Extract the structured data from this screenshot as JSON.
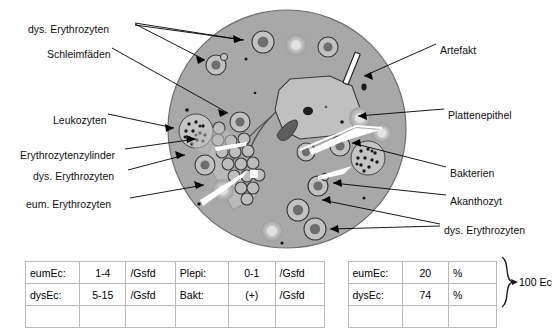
{
  "figure": {
    "type": "urine-sediment-microscopy-diagram",
    "field_shape": "circle",
    "labels_left": [
      {
        "id": "dys-erythrozyten-top",
        "text": "dys. Erythrozyten",
        "x": 28,
        "y": 23
      },
      {
        "id": "schleimfaeden",
        "text": "Schleimfäden",
        "x": 47,
        "y": 48
      },
      {
        "id": "leukozyten",
        "text": "Leukozyten",
        "x": 53,
        "y": 114
      },
      {
        "id": "erythrozytenzylinder",
        "text": "Erythrozytenzylinder",
        "x": 20,
        "y": 149
      },
      {
        "id": "dys-erythrozyten-mid",
        "text": "dys. Erythrozyten",
        "x": 33,
        "y": 170
      },
      {
        "id": "eum-erythrozyten",
        "text": "eum. Erythrozyten",
        "x": 26,
        "y": 198
      }
    ],
    "labels_right": [
      {
        "id": "artefakt",
        "text": "Artefakt",
        "x": 440,
        "y": 44
      },
      {
        "id": "plattenepithel",
        "text": "Plattenepithel",
        "x": 448,
        "y": 109
      },
      {
        "id": "bakterien",
        "text": "Bakterien",
        "x": 450,
        "y": 167
      },
      {
        "id": "akanthozyt",
        "text": "Akanthozyt",
        "x": 450,
        "y": 195
      },
      {
        "id": "dys-erythrozyten-bottom",
        "text": "dys. Erythrozyten",
        "x": 444,
        "y": 224
      }
    ]
  },
  "results_table": {
    "rows": [
      {
        "cells": [
          {
            "key": "eumEc:",
            "value": "1-4",
            "unit": "/Gsfd"
          },
          {
            "key": "Plepi:",
            "value": "0-1",
            "unit": "/Gsfd"
          },
          {
            "key": "eumEc:",
            "value": "20",
            "unit": "%"
          }
        ]
      },
      {
        "cells": [
          {
            "key": "dysEc:",
            "value": "5-15",
            "unit": "/Gsfd"
          },
          {
            "key": "Bakt:",
            "value": "(+)",
            "unit": "/Gsfd"
          },
          {
            "key": "dysEc:",
            "value": "74",
            "unit": "%"
          }
        ]
      }
    ],
    "brace_label": "100 Ec"
  },
  "colors": {
    "field_fill": "#a8a8a8",
    "field_edge": "#7d7d7d",
    "line": "#000000",
    "table_border": "#b9b9b9",
    "page_bg": "#ffffff"
  }
}
